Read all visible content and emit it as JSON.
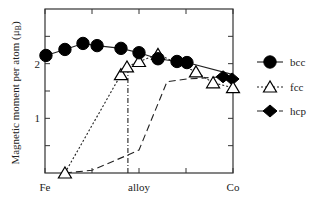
{
  "chart_data": {
    "type": "line",
    "title": "",
    "xlabel": "",
    "ylabel": "Magnetic moment per atom (μB)",
    "ylabel_main": "Magnetic moment per atom (μ",
    "ylabel_sub": "B",
    "ylabel_close": ")",
    "xlim": [
      0,
      1
    ],
    "ylim": [
      0,
      3
    ],
    "x_tick_labels": [
      {
        "x": 0,
        "label": "Fe"
      },
      {
        "x": 0.5,
        "label": "alloy"
      },
      {
        "x": 1,
        "label": "Co"
      }
    ],
    "x_ticks": [
      0,
      0.25,
      0.5,
      0.75,
      1
    ],
    "y_tick_labels": [
      {
        "y": 1,
        "label": "1"
      },
      {
        "y": 2,
        "label": "2"
      }
    ],
    "y_ticks": [
      0.5,
      1,
      1.5,
      2,
      2.5
    ],
    "grid": false,
    "legend_position": "right",
    "series": [
      {
        "name": "bcc",
        "marker": "circle",
        "line": "solid",
        "x": [
          0.005,
          0.106,
          0.202,
          0.277,
          0.404,
          0.5,
          0.601,
          0.702,
          0.755,
          1.0
        ],
        "y": [
          2.15,
          2.26,
          2.37,
          2.33,
          2.28,
          2.2,
          2.09,
          2.04,
          2.02,
          1.8
        ],
        "marker_indices": [
          0,
          1,
          2,
          3,
          4,
          5,
          6,
          7,
          8
        ]
      },
      {
        "name": "fcc",
        "marker": "triangle",
        "line": "dotted",
        "x": [
          0.106,
          0.404,
          0.436,
          0.5,
          0.601,
          0.803,
          0.894,
          1.0
        ],
        "y": [
          0.0,
          1.8,
          1.94,
          2.04,
          2.17,
          1.85,
          1.65,
          1.56
        ],
        "marker_indices": [
          0,
          1,
          2,
          3,
          4,
          5,
          6,
          7
        ]
      },
      {
        "name": "fcc-transition",
        "marker": "none",
        "line": "dashdot",
        "x": [
          0.441,
          0.441
        ],
        "y": [
          0.0,
          1.94
        ]
      },
      {
        "name": "hcp",
        "marker": "diamond",
        "line": "dashed",
        "x": [
          0.106,
          0.25,
          0.441,
          0.5,
          0.649,
          0.755,
          0.947,
          0.995
        ],
        "y": [
          0.0,
          0.05,
          0.33,
          0.42,
          1.67,
          1.72,
          1.76,
          1.72
        ],
        "marker_indices": [
          6,
          7
        ]
      }
    ],
    "legend": [
      {
        "label": "bcc",
        "marker": "circle",
        "line": "solid"
      },
      {
        "label": "fcc",
        "marker": "triangle",
        "line": "dotted"
      },
      {
        "label": "hcp",
        "marker": "diamond",
        "line": "dashed"
      }
    ]
  }
}
